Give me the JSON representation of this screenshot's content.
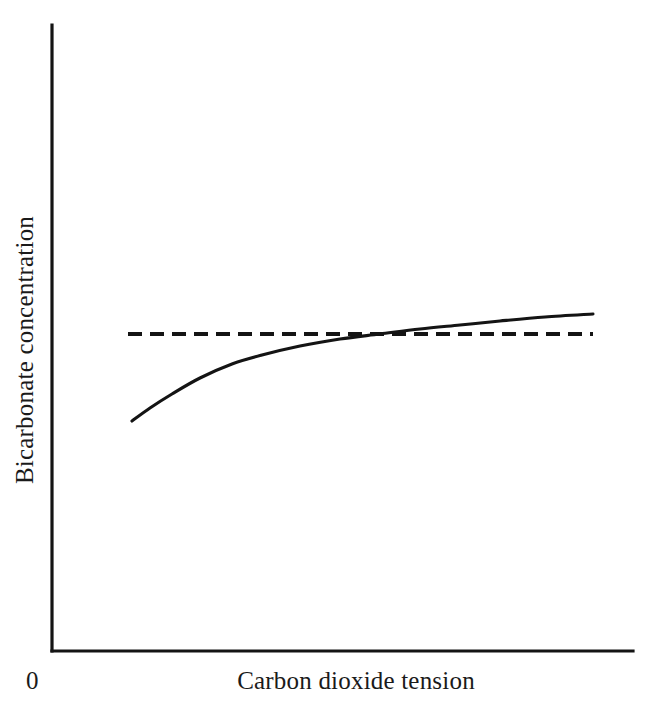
{
  "chart_data": {
    "type": "line",
    "title": "",
    "subtitle": "",
    "xlabel": "Carbon dioxide tension",
    "ylabel": "Bicarbonate concentration",
    "origin_label": "0",
    "grid": false,
    "legend": null,
    "axis_ranges": {
      "x": [
        0,
        100
      ],
      "y": [
        0,
        100
      ]
    },
    "axis_ticks": {
      "x": [],
      "y": []
    },
    "colors": {
      "line": "#141414",
      "axis": "#141414",
      "background": "#ffffff"
    },
    "series": [
      {
        "name": "Bicarbonate response curve",
        "style": "solid",
        "points": [
          {
            "x": 132,
            "y": 421
          },
          {
            "x": 150,
            "y": 408
          },
          {
            "x": 172,
            "y": 394
          },
          {
            "x": 200,
            "y": 378
          },
          {
            "x": 232,
            "y": 364
          },
          {
            "x": 262,
            "y": 355
          },
          {
            "x": 300,
            "y": 346
          },
          {
            "x": 340,
            "y": 339
          },
          {
            "x": 380,
            "y": 334
          },
          {
            "x": 420,
            "y": 329
          },
          {
            "x": 460,
            "y": 325
          },
          {
            "x": 500,
            "y": 321
          },
          {
            "x": 545,
            "y": 317
          },
          {
            "x": 593,
            "y": 314
          }
        ]
      },
      {
        "name": "Normal reference level",
        "style": "dashed",
        "points": [
          {
            "x": 128,
            "y": 334
          },
          {
            "x": 593,
            "y": 334
          }
        ]
      }
    ],
    "annotations": [
      {
        "name": "crossover",
        "description": "Solid curve crosses the dashed reference line",
        "x": 404,
        "y": 334
      }
    ],
    "geometry": {
      "y_axis_x": 52,
      "y_axis_top": 25,
      "y_axis_bottom": 651,
      "x_axis_y": 651,
      "x_axis_left": 52,
      "x_axis_right": 633
    }
  }
}
